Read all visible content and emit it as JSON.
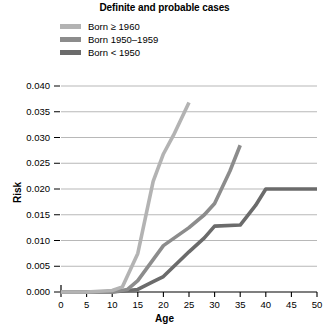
{
  "chart_data": {
    "type": "line",
    "title": "Definite and probable cases",
    "xlabel": "Age",
    "ylabel": "Risk",
    "xlim": [
      0,
      50
    ],
    "ylim": [
      0,
      0.04
    ],
    "grid": true,
    "legend_position": "top-left",
    "xticks": [
      "0",
      "5",
      "10",
      "15",
      "20",
      "25",
      "30",
      "35",
      "40",
      "45",
      "50"
    ],
    "xtick_values": [
      0,
      5,
      10,
      15,
      20,
      25,
      30,
      35,
      40,
      45,
      50
    ],
    "yticks": [
      "0.000",
      "0.005",
      "0.010",
      "0.015",
      "0.020",
      "0.025",
      "0.030",
      "0.035",
      "0.040"
    ],
    "ytick_values": [
      0.0,
      0.005,
      0.01,
      0.015,
      0.02,
      0.025,
      0.03,
      0.035,
      0.04
    ],
    "series": [
      {
        "name": "Born ≥ 1960",
        "color": "#b3b3b3",
        "x": [
          0,
          5,
          10,
          12,
          15,
          18,
          20,
          22,
          25
        ],
        "values": [
          0.0,
          0.0,
          0.0003,
          0.001,
          0.0075,
          0.0215,
          0.0268,
          0.0305,
          0.0368
        ]
      },
      {
        "name": "Born 1950–1959",
        "color": "#8c8c8c",
        "x": [
          0,
          5,
          10,
          13,
          15,
          20,
          25,
          28,
          30,
          33,
          35
        ],
        "values": [
          0.0,
          0.0,
          0.0,
          0.0005,
          0.0022,
          0.009,
          0.0125,
          0.015,
          0.0172,
          0.0235,
          0.0285
        ]
      },
      {
        "name": "Born < 1950",
        "color": "#6b6b6b",
        "x": [
          0,
          5,
          10,
          15,
          18,
          20,
          25,
          28,
          30,
          35,
          38,
          40,
          45,
          50
        ],
        "values": [
          0.0,
          0.0,
          0.0,
          0.0005,
          0.002,
          0.003,
          0.0078,
          0.0105,
          0.0128,
          0.013,
          0.0168,
          0.02,
          0.02,
          0.02
        ]
      }
    ]
  },
  "legend": {
    "items": [
      {
        "label": "Born ≥ 1960"
      },
      {
        "label": "Born 1950–1959"
      },
      {
        "label": "Born < 1950"
      }
    ]
  }
}
